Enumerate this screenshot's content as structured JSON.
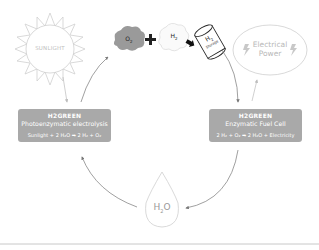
{
  "sun": {
    "label": "SUNLIGHT"
  },
  "reactants": {
    "o2": {
      "label": "O",
      "sub": "2"
    },
    "plus": "+",
    "h2": {
      "label": "H",
      "sub": "2"
    },
    "arrow": "➡",
    "storage": {
      "label": "H",
      "sub": "2",
      "caption": "Storage"
    }
  },
  "power": {
    "label_line1": "Electrical",
    "label_line2": "Power"
  },
  "left_box": {
    "brand": "H2GREEN",
    "title": "Photoenzymatic electrolysis",
    "equation": "Sunlight + 2 H₂O ➡ 2 H₂ + O₂"
  },
  "right_box": {
    "brand": "H2GREEN",
    "title": "Enzymatic Fuel Cell",
    "equation": "2 H₂ + O₂ ➡ 2 H₂O + Electricity"
  },
  "water": {
    "label": "H",
    "sub": "2",
    "suffix": "O"
  },
  "colors": {
    "box": "#a9a9a9",
    "outline": "#c8c8c8",
    "arrow": "#8a8a8a",
    "cloud_o2": "#9a9a9a"
  }
}
